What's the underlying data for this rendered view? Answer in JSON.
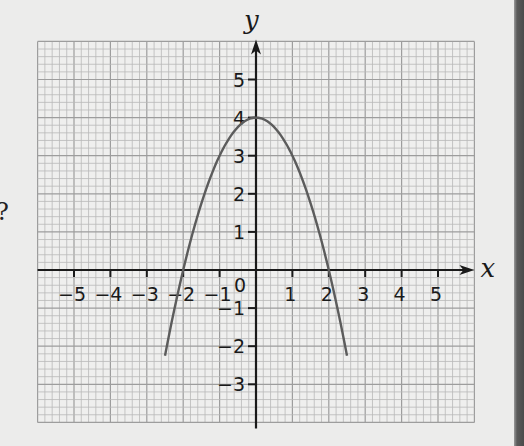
{
  "chart_data": {
    "type": "line",
    "title": "",
    "xlabel": "x",
    "ylabel": "y",
    "xlim": [
      -6,
      6
    ],
    "ylim": [
      -4,
      6
    ],
    "grid": true,
    "grid_minor_divisions_per_unit": 5,
    "x_ticks": [
      -5,
      -4,
      -3,
      -2,
      -1,
      1,
      2,
      3,
      4,
      5
    ],
    "x_tick_labels": [
      "−5",
      "−4",
      "−3",
      "−2",
      "−1",
      "1",
      "2",
      "3",
      "4",
      "5"
    ],
    "y_ticks": [
      -3,
      -2,
      -1,
      1,
      2,
      3,
      4,
      5
    ],
    "y_tick_labels": [
      "−3",
      "−2",
      "−1",
      "1",
      "2",
      "3",
      "4",
      "5"
    ],
    "origin_label": "0",
    "series": [
      {
        "name": "curve",
        "equation": "y = 4 - x^2",
        "x": [
          -2.5,
          -2,
          -1.5,
          -1,
          -0.5,
          0,
          0.5,
          1,
          1.5,
          2,
          2.5
        ],
        "y": [
          -2.25,
          0,
          1.75,
          3,
          3.75,
          4,
          3.75,
          3,
          1.75,
          0,
          -2.25
        ],
        "color": "#5c5c5c"
      }
    ],
    "annotations": {
      "vertex": [
        0,
        4
      ],
      "x_intercepts": [
        -2,
        2
      ],
      "y_intercept": 4
    }
  },
  "page": {
    "margin_glyph": "?",
    "colors": {
      "background": "#ececeb",
      "grid_minor": "#b9b9b9",
      "grid_major": "#9d9d9d",
      "axis": "#1a1a1a",
      "curve": "#5c5c5c"
    }
  }
}
